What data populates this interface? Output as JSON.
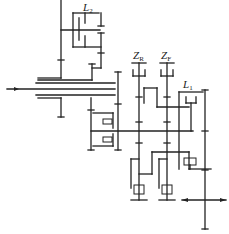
{
  "diagram": {
    "type": "gear-transmission-schematic",
    "labels": {
      "L2": {
        "main": "L",
        "sub": "2"
      },
      "ZR": {
        "main": "Z",
        "sub": "R"
      },
      "ZF": {
        "main": "Z",
        "sub": "F"
      },
      "L1": {
        "main": "L",
        "sub": "1"
      }
    },
    "colors": {
      "line": "#222222",
      "background": "#ffffff"
    }
  }
}
